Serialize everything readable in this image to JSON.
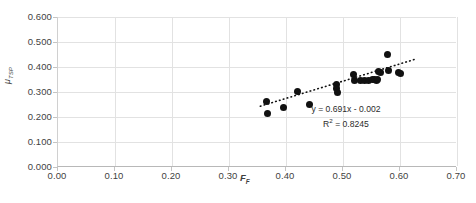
{
  "chart_data": {
    "type": "scatter",
    "title": "",
    "xlabel": "F_F",
    "xlabel_base": "F",
    "xlabel_sub": "F",
    "ylabel": "μ_TSP",
    "ylabel_base": "μ",
    "ylabel_sub": "TSP",
    "xlim": [
      0.0,
      0.7
    ],
    "ylim": [
      0.0,
      0.6
    ],
    "xticks": [
      "0.00",
      "0.10",
      "0.20",
      "0.30",
      "0.40",
      "0.50",
      "0.60",
      "0.70"
    ],
    "xtick_values": [
      0.0,
      0.1,
      0.2,
      0.3,
      0.4,
      0.5,
      0.6,
      0.7
    ],
    "yticks": [
      "0.000",
      "0.100",
      "0.200",
      "0.300",
      "0.400",
      "0.500",
      "0.600"
    ],
    "ytick_values": [
      0.0,
      0.1,
      0.2,
      0.3,
      0.4,
      0.5,
      0.6
    ],
    "grid": true,
    "legend": "none",
    "marker": "filled-circle",
    "marker_color": "#111111",
    "grid_color": "#e2e2e2",
    "trendline": {
      "type": "linear",
      "slope": 0.691,
      "intercept": -0.002,
      "r_squared": 0.8245,
      "style": "dotted",
      "color": "#111111",
      "x_start": 0.355,
      "x_end": 0.625
    },
    "annotations": {
      "equation": "y = 0.691x - 0.002",
      "r_squared_label": "R",
      "r_squared_sup": "2",
      "r_squared_value": " = 0.8245"
    },
    "x": [
      0.365,
      0.368,
      0.395,
      0.42,
      0.442,
      0.488,
      0.489,
      0.49,
      0.519,
      0.521,
      0.53,
      0.538,
      0.545,
      0.552,
      0.556,
      0.558,
      0.56,
      0.562,
      0.566,
      0.578,
      0.58,
      0.598,
      0.6
    ],
    "y": [
      0.262,
      0.213,
      0.238,
      0.302,
      0.25,
      0.33,
      0.315,
      0.3,
      0.372,
      0.345,
      0.345,
      0.348,
      0.348,
      0.35,
      0.352,
      0.348,
      0.35,
      0.382,
      0.378,
      0.452,
      0.388,
      0.378,
      0.375
    ],
    "points": [
      {
        "x": 0.365,
        "y": 0.262
      },
      {
        "x": 0.368,
        "y": 0.213
      },
      {
        "x": 0.395,
        "y": 0.238
      },
      {
        "x": 0.42,
        "y": 0.302
      },
      {
        "x": 0.442,
        "y": 0.25
      },
      {
        "x": 0.488,
        "y": 0.33
      },
      {
        "x": 0.489,
        "y": 0.315
      },
      {
        "x": 0.49,
        "y": 0.3
      },
      {
        "x": 0.519,
        "y": 0.372
      },
      {
        "x": 0.521,
        "y": 0.345
      },
      {
        "x": 0.53,
        "y": 0.345
      },
      {
        "x": 0.538,
        "y": 0.348
      },
      {
        "x": 0.545,
        "y": 0.348
      },
      {
        "x": 0.552,
        "y": 0.35
      },
      {
        "x": 0.556,
        "y": 0.352
      },
      {
        "x": 0.558,
        "y": 0.348
      },
      {
        "x": 0.56,
        "y": 0.35
      },
      {
        "x": 0.562,
        "y": 0.382
      },
      {
        "x": 0.566,
        "y": 0.378
      },
      {
        "x": 0.578,
        "y": 0.452
      },
      {
        "x": 0.58,
        "y": 0.388
      },
      {
        "x": 0.598,
        "y": 0.378
      },
      {
        "x": 0.6,
        "y": 0.375
      }
    ]
  }
}
